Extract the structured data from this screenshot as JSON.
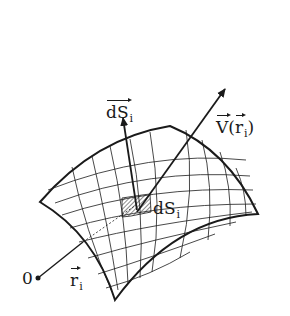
{
  "figure": {
    "labels": {
      "normal_vector": {
        "base": "dS",
        "subscript": "i",
        "is_vector": true
      },
      "field_vector": {
        "base": "V",
        "paren_open": "(",
        "arg": "r",
        "arg_subscript": "i",
        "paren_close": ")",
        "is_vector": true
      },
      "surface_element": {
        "base": "dS",
        "subscript": "i"
      },
      "position_vector": {
        "base": "r",
        "subscript": "i",
        "is_vector": true
      },
      "origin": "0"
    },
    "colors": {
      "ink": "#1a1a1a",
      "background": "#ffffff"
    }
  }
}
